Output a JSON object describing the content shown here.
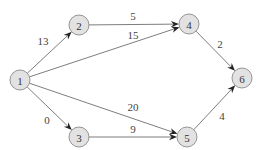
{
  "diagram": {
    "type": "directed-weighted-graph",
    "nodes": [
      {
        "id": "1",
        "label": "1"
      },
      {
        "id": "2",
        "label": "2"
      },
      {
        "id": "3",
        "label": "3"
      },
      {
        "id": "4",
        "label": "4"
      },
      {
        "id": "5",
        "label": "5"
      },
      {
        "id": "6",
        "label": "6"
      }
    ],
    "edges": [
      {
        "from": "1",
        "to": "2",
        "weight": "13"
      },
      {
        "from": "1",
        "to": "4",
        "weight": "15"
      },
      {
        "from": "1",
        "to": "5",
        "weight": "20"
      },
      {
        "from": "1",
        "to": "3",
        "weight": "0"
      },
      {
        "from": "2",
        "to": "4",
        "weight": "5"
      },
      {
        "from": "3",
        "to": "5",
        "weight": "9"
      },
      {
        "from": "4",
        "to": "6",
        "weight": "2"
      },
      {
        "from": "5",
        "to": "6",
        "weight": "4"
      }
    ]
  }
}
